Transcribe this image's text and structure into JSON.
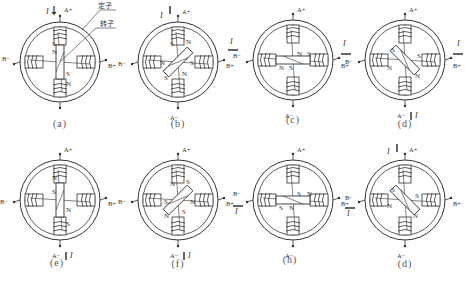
{
  "figure": {
    "legend": {
      "stator_label": "定子",
      "rotor_label": "转子"
    },
    "terminal_labels": {
      "a_plus": "A+",
      "a_minus": "A−",
      "b_plus": "B+",
      "b_minus": "B−"
    },
    "current_symbol": "I",
    "panels": [
      {
        "id": "a",
        "caption": "(a)",
        "cx": 60,
        "cy": 62,
        "rotor_angle": 90,
        "current_at": [
          "A+"
        ],
        "poles": {
          "top": [
            "S",
            "N"
          ],
          "bottom": [
            "S",
            "N"
          ]
        }
      },
      {
        "id": "b",
        "caption": "(b)",
        "cx": 178,
        "cy": 62,
        "rotor_angle": 135,
        "current_at": [
          "A+",
          "B+"
        ],
        "poles": {
          "top": "S N",
          "left": "N",
          "right": "S",
          "bottom": "S N"
        }
      },
      {
        "id": "c",
        "caption": "(c)",
        "cx": 293,
        "cy": 58,
        "rotor_angle": 0,
        "current_at": [
          "B+"
        ],
        "poles": {
          "rotor_left": "N S",
          "rotor_right": "N S"
        }
      },
      {
        "id": "d",
        "caption": "(d)",
        "cx": 405,
        "cy": 60,
        "rotor_angle": 45,
        "current_at": [
          "B+",
          "A−"
        ],
        "poles": {
          "left": "S N",
          "right": "S N"
        }
      },
      {
        "id": "e",
        "caption": "(e)",
        "cx": 60,
        "cy": 200,
        "rotor_angle": 90,
        "current_at": [
          "A−"
        ],
        "poles": {
          "top": "N S",
          "bottom": "N S"
        }
      },
      {
        "id": "f",
        "caption": "(f)",
        "cx": 178,
        "cy": 200,
        "rotor_angle": 135,
        "current_at": [
          "A−"
        ],
        "poles": {
          "top": "N S",
          "bottom": "N S",
          "left": "S",
          "right": "N"
        }
      },
      {
        "id": "h",
        "caption": "(h)",
        "cx": 293,
        "cy": 200,
        "rotor_angle": 0,
        "current_at": [
          "B−"
        ],
        "poles": {
          "rotor_left": "S N",
          "rotor_right": "S N"
        }
      },
      {
        "id": "d2",
        "caption": "(d)",
        "cx": 405,
        "cy": 200,
        "rotor_angle": 45,
        "current_at": [
          "A+",
          "B−"
        ],
        "poles": {
          "left": "S N",
          "right": "S N"
        }
      }
    ]
  },
  "colors": {
    "line": "#333333",
    "background": "#ffffff",
    "caption": "#555555"
  }
}
